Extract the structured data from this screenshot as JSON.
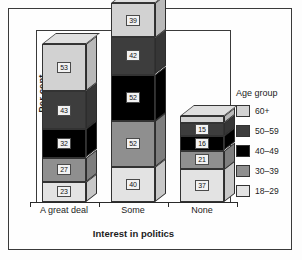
{
  "chart_data": {
    "type": "bar",
    "subtype": "stacked-3d-column",
    "title": "",
    "xlabel": "Interest in politics",
    "ylabel": "Per cent",
    "categories": [
      "A great deal",
      "Some",
      "None"
    ],
    "legend_title": "Age group",
    "legend_position": "right",
    "grid": false,
    "ylim": [
      0,
      200
    ],
    "series": [
      {
        "name": "18–29",
        "color": "#e3e3e3",
        "values": [
          23,
          40,
          37
        ]
      },
      {
        "name": "30–39",
        "color": "#8f8f8f",
        "values": [
          27,
          52,
          21
        ]
      },
      {
        "name": "40–49",
        "color": "#000000",
        "values": [
          32,
          52,
          16
        ]
      },
      {
        "name": "50–59",
        "color": "#3d3d3d",
        "values": [
          43,
          42,
          15
        ]
      },
      {
        "name": "60+",
        "color": "#d2d2d2",
        "values": [
          53,
          39,
          8
        ]
      }
    ],
    "stack_order_bottom_to_top": [
      "18–29",
      "30–39",
      "40–49",
      "50–59",
      "60+"
    ],
    "data_labels": {
      "A great deal": [
        "23",
        "27",
        "32",
        "43",
        "53"
      ],
      "Some": [
        "40",
        "52",
        "52",
        "42",
        "39"
      ],
      "None": [
        "37",
        "21",
        "16",
        "15",
        ""
      ]
    }
  },
  "axes": {
    "y_title": "Per cent",
    "x_title": "Interest in politics",
    "tick_labels": [
      "A great deal",
      "Some",
      "None"
    ]
  },
  "legend": {
    "title": "Age group",
    "items": [
      {
        "label": "60+",
        "color": "#d2d2d2"
      },
      {
        "label": "50–59",
        "color": "#3d3d3d"
      },
      {
        "label": "40–49",
        "color": "#000000"
      },
      {
        "label": "30–39",
        "color": "#8f8f8f"
      },
      {
        "label": "18–29",
        "color": "#e3e3e3"
      }
    ]
  },
  "colors": {
    "frame": "#3a3a3a",
    "background": "#fefefe",
    "text": "#1c1c1c",
    "label_box": "#f2f2f2"
  }
}
